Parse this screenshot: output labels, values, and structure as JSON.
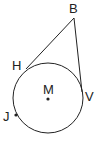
{
  "diagram": {
    "labels": {
      "B": "B",
      "H": "H",
      "M": "M",
      "V": "V",
      "J": "J"
    },
    "circle": {
      "center": "M",
      "cx": 48,
      "cy": 98,
      "r": 35
    },
    "tangents": [
      "BH",
      "BV"
    ],
    "colors": {
      "stroke": "#222222",
      "background": "#ffffff"
    }
  }
}
